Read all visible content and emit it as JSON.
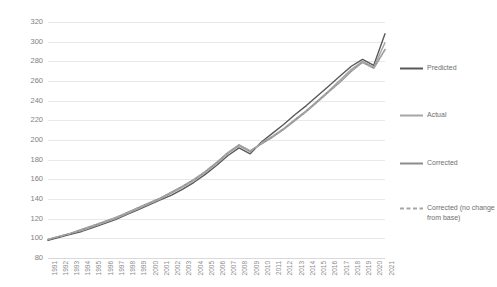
{
  "chart_data": {
    "type": "line",
    "title": "",
    "xlabel": "",
    "ylabel": "",
    "ylim": [
      80,
      320
    ],
    "ytick_step": 20,
    "grid": true,
    "legend_position": "right",
    "yticks": [
      320,
      300,
      280,
      260,
      240,
      220,
      200,
      180,
      160,
      140,
      120,
      100,
      80
    ],
    "categories": [
      "1991",
      "1992",
      "1993",
      "1994",
      "1995",
      "1996",
      "1997",
      "1998",
      "1999",
      "2000",
      "2001",
      "2002",
      "2003",
      "2004",
      "2005",
      "2006",
      "2007",
      "2008",
      "2009",
      "2010",
      "2011",
      "2012",
      "2013",
      "2014",
      "2015",
      "2016",
      "2017",
      "2018",
      "2019",
      "2020",
      "2021"
    ],
    "series": [
      {
        "name": "Predicted",
        "color": "#595959",
        "dashed": false,
        "values": [
          98,
          101,
          104,
          107,
          111,
          115,
          119,
          124,
          129,
          134,
          139,
          144,
          150,
          157,
          165,
          174,
          184,
          192,
          186,
          198,
          207,
          216,
          226,
          235,
          245,
          255,
          265,
          275,
          282,
          276,
          308
        ]
      },
      {
        "name": "Actual",
        "color": "#a6a6a6",
        "dashed": false,
        "values": [
          99,
          102,
          105,
          108,
          112,
          116,
          120,
          125,
          130,
          135,
          140,
          146,
          152,
          159,
          167,
          176,
          186,
          194,
          188,
          197,
          204,
          212,
          221,
          230,
          240,
          250,
          261,
          272,
          280,
          274,
          299
        ]
      },
      {
        "name": "Corrected",
        "color": "#8c8c8c",
        "dashed": false,
        "values": [
          99,
          102,
          105,
          109,
          113,
          117,
          121,
          126,
          131,
          136,
          141,
          147,
          153,
          160,
          168,
          177,
          187,
          195,
          189,
          196,
          203,
          211,
          220,
          229,
          239,
          249,
          259,
          270,
          279,
          273,
          292
        ]
      },
      {
        "name": "Corrected (no change from base)",
        "color": "#a6a6a6",
        "dashed": true,
        "values": [
          99,
          102,
          105,
          109,
          113,
          117,
          121,
          126,
          131,
          136,
          141,
          147,
          153,
          160,
          168,
          177,
          187,
          195,
          189,
          196,
          203,
          211,
          220,
          229,
          239,
          249,
          259,
          270,
          279,
          273,
          292
        ]
      }
    ]
  },
  "legend": {
    "items": [
      {
        "label": "Predicted"
      },
      {
        "label": "Actual"
      },
      {
        "label": "Corrected"
      },
      {
        "label": "Corrected (no change from base)"
      }
    ]
  }
}
